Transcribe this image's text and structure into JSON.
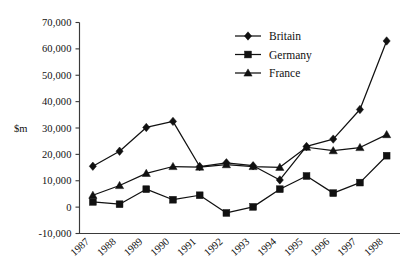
{
  "chart_data": {
    "type": "line",
    "title": "",
    "subtitle": "",
    "xlabel": "",
    "ylabel": "$m",
    "ylim": [
      -10000,
      70000
    ],
    "ytick_step": 10000,
    "grid": false,
    "legend_position": "top-center-right",
    "categories": [
      "1987",
      "1988",
      "1989",
      "1990",
      "1991",
      "1992",
      "1993",
      "1994",
      "1995",
      "1996",
      "1997",
      "1998"
    ],
    "ytick_labels": [
      "-10,000",
      "0",
      "10,000",
      "20,000",
      "30,000",
      "40,000",
      "50,000",
      "60,000",
      "70,000"
    ],
    "ytick_values": [
      -10000,
      0,
      10000,
      20000,
      30000,
      40000,
      50000,
      60000,
      70000
    ],
    "series": [
      {
        "name": "Britain",
        "marker": "diamond",
        "values": [
          15500,
          21200,
          30200,
          32500,
          15400,
          16800,
          15700,
          10300,
          23000,
          25800,
          37000,
          63000
        ]
      },
      {
        "name": "Germany",
        "marker": "square",
        "values": [
          2000,
          1100,
          6800,
          2800,
          4500,
          -2200,
          100,
          6800,
          11800,
          5300,
          9300,
          19500
        ]
      },
      {
        "name": "France",
        "marker": "triangle",
        "values": [
          4500,
          8200,
          12800,
          15400,
          15200,
          16100,
          15400,
          15100,
          22700,
          21400,
          22600,
          27500
        ]
      }
    ]
  },
  "legend": {
    "items": [
      {
        "label": "Britain",
        "marker": "diamond"
      },
      {
        "label": "Germany",
        "marker": "square"
      },
      {
        "label": "France",
        "marker": "triangle"
      }
    ]
  },
  "axis": {
    "y_unit": "$m"
  }
}
